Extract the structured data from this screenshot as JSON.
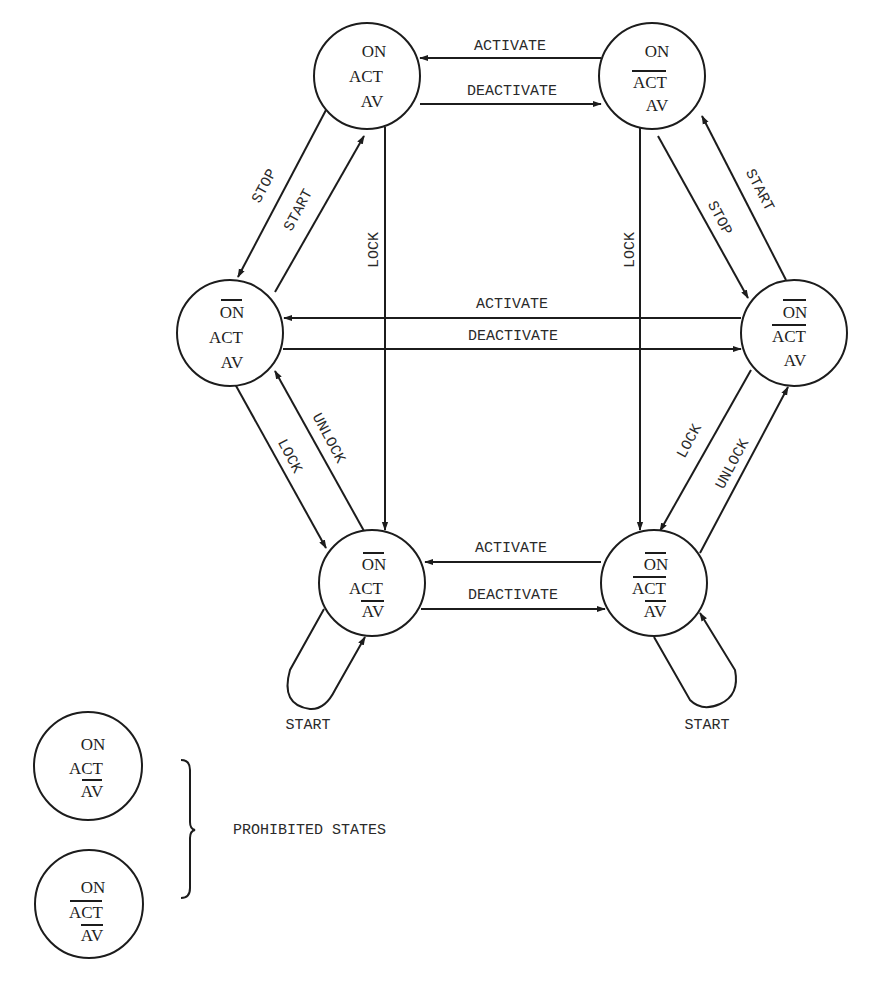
{
  "diagram": {
    "type": "state-transition",
    "colors": {
      "line": "#1c1c1c",
      "text": "#2a2a2a",
      "background": "#ffffff"
    },
    "states": [
      {
        "id": "s1",
        "lines": [
          "ON",
          "ACT",
          "AV"
        ],
        "negated": [
          false,
          false,
          false
        ]
      },
      {
        "id": "s2",
        "lines": [
          "ON",
          "ACT",
          "AV"
        ],
        "negated": [
          false,
          true,
          false
        ]
      },
      {
        "id": "s3",
        "lines": [
          "ON",
          "ACT",
          "AV"
        ],
        "negated": [
          true,
          false,
          false
        ]
      },
      {
        "id": "s4",
        "lines": [
          "ON",
          "ACT",
          "AV"
        ],
        "negated": [
          true,
          true,
          false
        ]
      },
      {
        "id": "s5",
        "lines": [
          "ON",
          "ACT",
          "AV"
        ],
        "negated": [
          true,
          false,
          true
        ]
      },
      {
        "id": "s6",
        "lines": [
          "ON",
          "ACT",
          "AV"
        ],
        "negated": [
          true,
          true,
          true
        ]
      }
    ],
    "prohibited_states": [
      {
        "id": "p1",
        "lines": [
          "ON",
          "ACT",
          "AV"
        ],
        "negated": [
          false,
          false,
          true
        ]
      },
      {
        "id": "p2",
        "lines": [
          "ON",
          "ACT",
          "AV"
        ],
        "negated": [
          false,
          true,
          true
        ]
      }
    ],
    "transitions": [
      {
        "from": "s2",
        "to": "s1",
        "label": "ACTIVATE"
      },
      {
        "from": "s1",
        "to": "s2",
        "label": "DEACTIVATE"
      },
      {
        "from": "s1",
        "to": "s3",
        "label": "STOP"
      },
      {
        "from": "s3",
        "to": "s1",
        "label": "START"
      },
      {
        "from": "s2",
        "to": "s4",
        "label": "STOP"
      },
      {
        "from": "s4",
        "to": "s2",
        "label": "START"
      },
      {
        "from": "s1",
        "to": "s5",
        "label": "LOCK"
      },
      {
        "from": "s2",
        "to": "s6",
        "label": "LOCK"
      },
      {
        "from": "s4",
        "to": "s3",
        "label": "ACTIVATE"
      },
      {
        "from": "s3",
        "to": "s4",
        "label": "DEACTIVATE"
      },
      {
        "from": "s3",
        "to": "s5",
        "label": "LOCK"
      },
      {
        "from": "s5",
        "to": "s3",
        "label": "UNLOCK"
      },
      {
        "from": "s4",
        "to": "s6",
        "label": "LOCK"
      },
      {
        "from": "s6",
        "to": "s4",
        "label": "UNLOCK"
      },
      {
        "from": "s6",
        "to": "s5",
        "label": "ACTIVATE"
      },
      {
        "from": "s5",
        "to": "s6",
        "label": "DEACTIVATE"
      },
      {
        "from": "s5",
        "to": "s5",
        "label": "START"
      },
      {
        "from": "s6",
        "to": "s6",
        "label": "START"
      }
    ],
    "labels": {
      "on": "ON",
      "act": "ACT",
      "av": "AV",
      "activate": "ACTIVATE",
      "deactivate": "DEACTIVATE",
      "stop": "STOP",
      "start": "START",
      "lock": "LOCK",
      "unlock": "UNLOCK",
      "prohibited": "PROHIBITED STATES"
    }
  }
}
